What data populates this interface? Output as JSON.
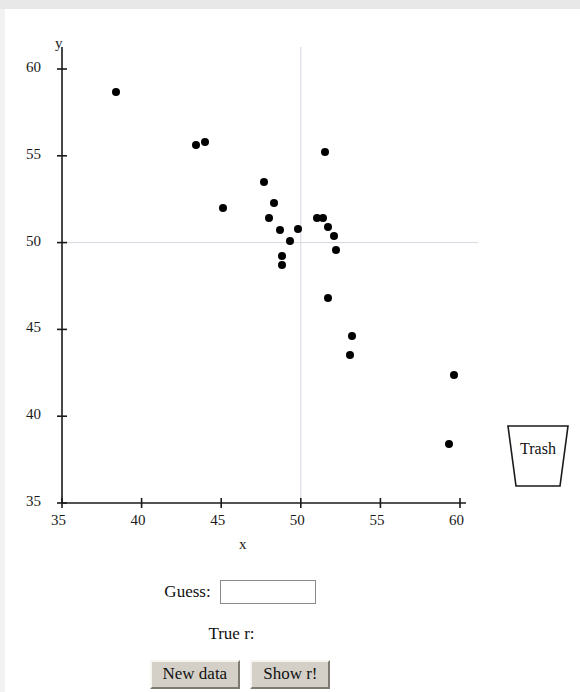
{
  "app": {
    "title": "Guess the Correlation"
  },
  "trash": {
    "label": "Trash",
    "name": "trash-can"
  },
  "controls": {
    "guess_label": "Guess:",
    "guess_value": "",
    "guess_placeholder": "",
    "true_r_label": "True r:",
    "true_r_value": "",
    "new_data_label": "New data",
    "show_r_label": "Show r!"
  },
  "colors": {
    "point": "#000000",
    "axis": "#1a1a1a",
    "gridline": "#d8d8e4",
    "button_face": "#d4d0c8",
    "input_border": "#8a8a8a",
    "page_background": "#ffffff"
  },
  "chart_data": {
    "type": "scatter",
    "title": "",
    "xlabel": "x",
    "ylabel": "y",
    "xlim": [
      35,
      60
    ],
    "ylim": [
      35,
      60
    ],
    "xticks": [
      35,
      40,
      45,
      50,
      55,
      60
    ],
    "yticks": [
      35,
      40,
      45,
      50,
      55,
      60
    ],
    "grid": false,
    "crosshair": {
      "x": 50,
      "y": 50
    },
    "legend": null,
    "n_points": 23,
    "points": [
      {
        "x": 38.4,
        "y": 58.7
      },
      {
        "x": 43.4,
        "y": 55.6
      },
      {
        "x": 44.0,
        "y": 55.8
      },
      {
        "x": 45.1,
        "y": 52.0
      },
      {
        "x": 47.7,
        "y": 53.5
      },
      {
        "x": 48.3,
        "y": 52.3
      },
      {
        "x": 48.0,
        "y": 51.4
      },
      {
        "x": 48.7,
        "y": 50.7
      },
      {
        "x": 48.8,
        "y": 49.2
      },
      {
        "x": 48.8,
        "y": 48.7
      },
      {
        "x": 49.3,
        "y": 50.1
      },
      {
        "x": 51.0,
        "y": 51.4
      },
      {
        "x": 51.4,
        "y": 51.4
      },
      {
        "x": 51.5,
        "y": 55.2
      },
      {
        "x": 51.7,
        "y": 50.9
      },
      {
        "x": 51.7,
        "y": 46.8
      },
      {
        "x": 52.1,
        "y": 50.4
      },
      {
        "x": 52.2,
        "y": 49.6
      },
      {
        "x": 53.2,
        "y": 44.6
      },
      {
        "x": 53.1,
        "y": 43.5
      },
      {
        "x": 59.6,
        "y": 42.4
      },
      {
        "x": 59.3,
        "y": 38.4
      },
      {
        "x": 49.8,
        "y": 50.8
      }
    ]
  }
}
